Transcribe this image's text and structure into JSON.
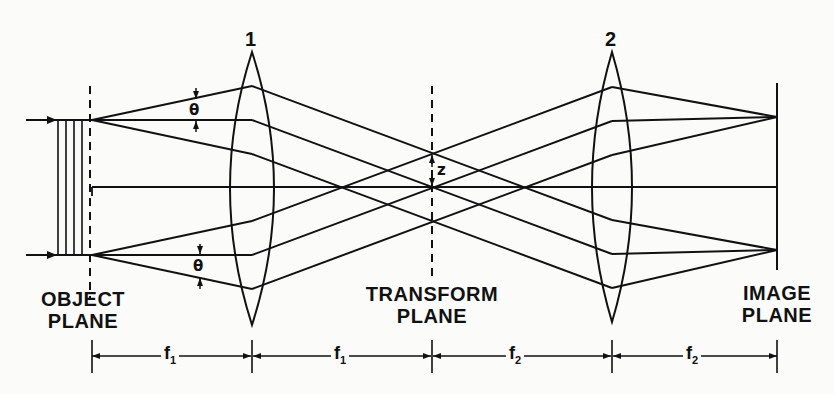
{
  "diagram": {
    "type": "optical 4f Fourier transform system",
    "lenses": [
      {
        "label": "1",
        "x": 252
      },
      {
        "label": "2",
        "x": 612
      }
    ],
    "planes": {
      "object": {
        "line1": "OBJECT",
        "line2": "PLANE"
      },
      "transform": {
        "line1": "TRANSFORM",
        "line2": "PLANE"
      },
      "image": {
        "line1": "IMAGE",
        "line2": "PLANE"
      }
    },
    "angle_symbol_top": "θ",
    "angle_symbol_bottom": "θ",
    "transform_offset_symbol": "z",
    "dimensions": [
      {
        "label": "f",
        "sub": "1"
      },
      {
        "label": "f",
        "sub": "1"
      },
      {
        "label": "f",
        "sub": "2"
      },
      {
        "label": "f",
        "sub": "2"
      }
    ],
    "colors": {
      "ink": "#111111",
      "background": "#fbfbf9"
    }
  }
}
